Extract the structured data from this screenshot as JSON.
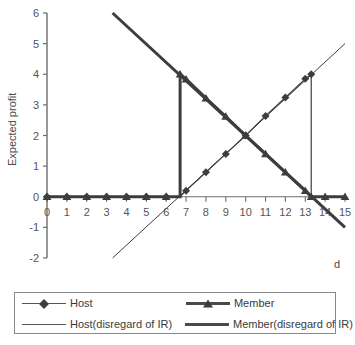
{
  "chart_data": {
    "type": "line",
    "title": "",
    "xlabel": "d",
    "ylabel": "Expected profit",
    "xlim": [
      0,
      15
    ],
    "ylim": [
      -2,
      6
    ],
    "grid": false,
    "legend_position": "bottom",
    "x_ticks": [
      "0",
      "1",
      "2",
      "3",
      "4",
      "5",
      "6",
      "7",
      "8",
      "9",
      "10",
      "11",
      "12",
      "13",
      "14",
      "15"
    ],
    "y_ticks": [
      "6",
      "5",
      "4",
      "3",
      "2",
      "1",
      "0",
      "-1",
      "-2"
    ],
    "series": [
      {
        "name": "Host",
        "marker": "diamond",
        "line_width": "thin",
        "x": [
          0,
          1,
          2,
          3,
          4,
          5,
          6,
          6.7,
          7,
          8,
          9,
          10,
          11,
          12,
          13,
          13.3,
          13.3,
          14,
          15
        ],
        "values": [
          0,
          0,
          0,
          0,
          0,
          0,
          0,
          0,
          0.2,
          0.8,
          1.4,
          2.0,
          2.64,
          3.24,
          3.85,
          4.0,
          0,
          0,
          0
        ]
      },
      {
        "name": "Member",
        "marker": "triangle",
        "line_width": "thick",
        "x": [
          0,
          1,
          2,
          3,
          4,
          5,
          6,
          6.7,
          6.7,
          7,
          8,
          9,
          10,
          11,
          12,
          13,
          13.3,
          14,
          15
        ],
        "values": [
          0,
          0,
          0,
          0,
          0,
          0,
          0,
          0,
          4.0,
          3.84,
          3.22,
          2.62,
          2.0,
          1.4,
          0.8,
          0.2,
          0,
          0,
          0
        ]
      },
      {
        "name": "Host(disregard of IR)",
        "marker": "none",
        "line_width": "thin",
        "x": [
          3.3,
          15
        ],
        "values": [
          -2.0,
          5.0
        ]
      },
      {
        "name": "Member(disregard of IR)",
        "marker": "none",
        "line_width": "thick",
        "x": [
          3.3,
          15
        ],
        "values": [
          6.0,
          -1.0
        ]
      }
    ],
    "annotations": [
      {
        "name": "member-jump",
        "x": 6.7,
        "y_from": 0,
        "y_to": 4.0
      },
      {
        "name": "host-drop",
        "x": 13.3,
        "y_from": 4.0,
        "y_to": 0
      }
    ]
  },
  "axes": {
    "y_label": "Expected profit",
    "x_label": "d",
    "y_tick_labels": [
      "6",
      "5",
      "4",
      "3",
      "2",
      "1",
      "0",
      "-1",
      "-2"
    ],
    "x_tick_labels": [
      "0",
      "1",
      "2",
      "3",
      "4",
      "5",
      "6",
      "7",
      "8",
      "9",
      "10",
      "11",
      "12",
      "13",
      "14",
      "15"
    ]
  },
  "legend": {
    "rows": [
      {
        "left": {
          "label": "Host",
          "marker": "diamond-marker",
          "line": "thin"
        },
        "right": {
          "label": "Member",
          "marker": "triangle-marker",
          "line": "thick"
        }
      },
      {
        "left": {
          "label": "Host(disregard of IR)",
          "marker": "none",
          "line": "thin"
        },
        "right": {
          "label": "Member(disregard of IR)",
          "marker": "none",
          "line": "thick"
        }
      }
    ]
  },
  "colors": {
    "series_dark": "#3d3d3d",
    "axis": "#6e6e6e",
    "text": "#3a3a3a",
    "background": "#ffffff"
  }
}
